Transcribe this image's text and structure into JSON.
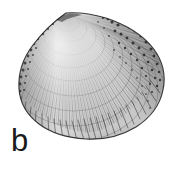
{
  "figure": {
    "label": "b",
    "background_color": "#ffffff",
    "ink_color": "#1a1a1a",
    "style": "pen-and-ink stipple and hatch scientific illustration",
    "outline": {
      "umbo_x": 66,
      "umbo_y": 13,
      "left_x": 19,
      "right_x": 164,
      "bottom_y": 139
    },
    "shading": {
      "light_region": "anterior-dorsal",
      "dark_region": "posterior-dorsal",
      "darkest_color": "#262626",
      "midtone_color": "#6b6b6b",
      "light_color": "#cfcfcf"
    },
    "ornament": {
      "concentric_growth_lines": 14,
      "radial_ribs": 96
    }
  }
}
